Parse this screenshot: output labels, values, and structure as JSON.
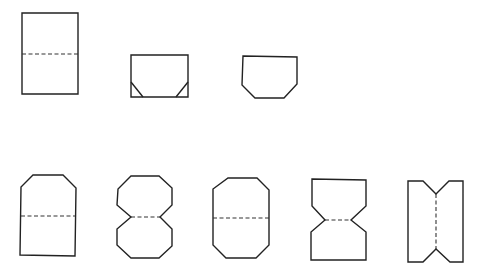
{
  "diagram": {
    "background": "#ffffff",
    "stroke_color": "#222222",
    "fold_color": "#333333",
    "shapes": [
      {
        "id": "rectangle-with-fold",
        "outline": "22,13 78,13 78,94 22,94",
        "folds": [
          {
            "x1": 22,
            "y1": 54,
            "x2": 78,
            "y2": 54
          }
        ]
      },
      {
        "id": "rectangle-with-corner-marks",
        "outline": "131,55 188,55 188,97 131,97",
        "marks": [
          {
            "x1": 131,
            "y1": 82,
            "x2": 143,
            "y2": 97
          },
          {
            "x1": 176,
            "y1": 97,
            "x2": 188,
            "y2": 82
          }
        ]
      },
      {
        "id": "clipped-bottom-corners",
        "outline": "243,56 297,57 297,84 284,98 255,98 242,85"
      },
      {
        "id": "clipped-top-corners-with-fold",
        "outline": "33,175 63,175 76,188 75,256 20,255 21,187",
        "folds": [
          {
            "x1": 21,
            "y1": 216,
            "x2": 75,
            "y2": 216
          }
        ]
      },
      {
        "id": "double-octagon-with-fold",
        "outline": "131,176 159,176 172,188 172,205 160,217 172,229 172,246 159,258 131,258 117,245 117,229 131,217 117,205 118,189",
        "folds": [
          {
            "x1": 131,
            "y1": 217,
            "x2": 160,
            "y2": 217
          }
        ]
      },
      {
        "id": "tall-octagon-with-fold",
        "outline": "228,178 257,178 269,190 269,245 256,258 226,258 213,245 213,189",
        "folds": [
          {
            "x1": 213,
            "y1": 218,
            "x2": 269,
            "y2": 218
          }
        ]
      },
      {
        "id": "hourglass-with-fold",
        "outline": "312,179 366,180 366,206 351,220 366,232 366,260 311,260 311,232 325,220 312,206",
        "folds": [
          {
            "x1": 325,
            "y1": 220,
            "x2": 351,
            "y2": 220
          }
        ]
      },
      {
        "id": "vertical-notched-with-fold",
        "outline": "408,181 423,181 436,194 449,181 463,181 463,262 450,262 436,249 423,262 408,262",
        "folds": [
          {
            "x1": 436,
            "y1": 194,
            "x2": 436,
            "y2": 249
          }
        ]
      }
    ]
  }
}
